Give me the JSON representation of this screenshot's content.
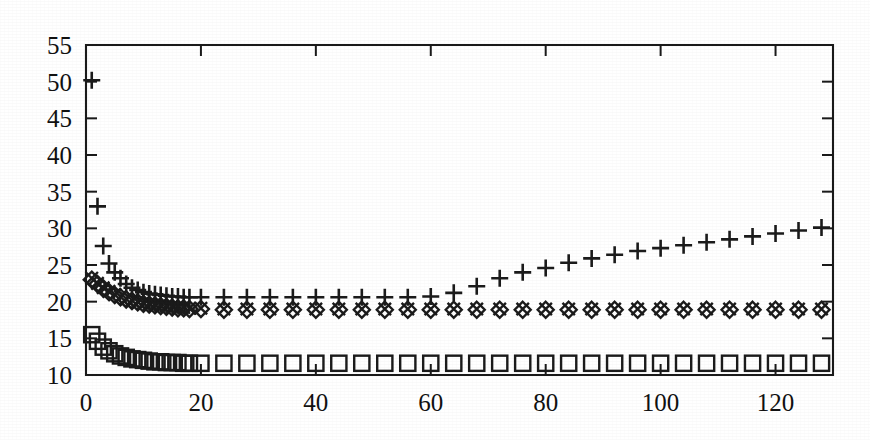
{
  "figure": {
    "title": "",
    "background_color": "#ffffff",
    "ink_color": "#1b1b1b"
  },
  "axes": {
    "y_ticklabels": [
      "10",
      "15",
      "20",
      "25",
      "30",
      "35",
      "40",
      "45",
      "50",
      "55"
    ],
    "x_ticklabels": [
      "0",
      "20",
      "40",
      "60",
      "80",
      "100",
      "120"
    ],
    "xlabel": "",
    "ylabel": ""
  },
  "chart_data": {
    "type": "scatter",
    "title": "",
    "xlabel": "",
    "ylabel": "",
    "xlim": [
      0,
      130
    ],
    "ylim": [
      10,
      55
    ],
    "xticks": [
      0,
      20,
      40,
      60,
      80,
      100,
      120
    ],
    "yticks": [
      10,
      15,
      20,
      25,
      30,
      35,
      40,
      45,
      50,
      55
    ],
    "grid": false,
    "legend": "none",
    "series": [
      {
        "name": "plus-series",
        "marker": "plus",
        "x": [
          1,
          2,
          3,
          4,
          5,
          6,
          7,
          8,
          9,
          10,
          11,
          12,
          13,
          14,
          15,
          16,
          17,
          18,
          20,
          24,
          28,
          32,
          36,
          40,
          44,
          48,
          52,
          56,
          60,
          64,
          68,
          72,
          76,
          80,
          84,
          88,
          92,
          96,
          100,
          104,
          108,
          112,
          116,
          120,
          124,
          128
        ],
        "y": [
          50.2,
          33.0,
          27.6,
          25.2,
          24.0,
          23.2,
          22.4,
          21.9,
          21.6,
          21.3,
          21.1,
          21.0,
          20.9,
          20.8,
          20.7,
          20.7,
          20.6,
          20.6,
          20.6,
          20.6,
          20.6,
          20.6,
          20.6,
          20.6,
          20.6,
          20.6,
          20.6,
          20.6,
          20.7,
          21.2,
          22.1,
          23.2,
          24.0,
          24.6,
          25.3,
          25.9,
          26.4,
          26.9,
          27.3,
          27.7,
          28.1,
          28.5,
          28.9,
          29.3,
          29.7,
          30.1
        ]
      },
      {
        "name": "diamond-series",
        "marker": "diamond",
        "x": [
          1,
          2,
          3,
          4,
          5,
          6,
          7,
          8,
          9,
          10,
          11,
          12,
          13,
          14,
          15,
          16,
          17,
          18,
          20,
          24,
          28,
          32,
          36,
          40,
          44,
          48,
          52,
          56,
          60,
          64,
          68,
          72,
          76,
          80,
          84,
          88,
          92,
          96,
          100,
          104,
          108,
          112,
          116,
          120,
          124,
          128
        ],
        "y": [
          23.0,
          22.4,
          21.8,
          21.3,
          20.9,
          20.6,
          20.3,
          20.1,
          19.9,
          19.7,
          19.6,
          19.5,
          19.4,
          19.3,
          19.2,
          19.1,
          19.1,
          19.0,
          19.0,
          18.9,
          18.9,
          18.9,
          18.9,
          18.9,
          18.9,
          18.9,
          18.9,
          18.9,
          18.9,
          18.9,
          18.9,
          18.9,
          18.9,
          18.9,
          18.9,
          18.9,
          18.9,
          18.9,
          18.9,
          18.9,
          18.9,
          18.9,
          18.9,
          18.9,
          18.9,
          18.9
        ]
      },
      {
        "name": "cross-series",
        "marker": "cross",
        "x": [
          1,
          2,
          3,
          4,
          5,
          6,
          7,
          8,
          9,
          10,
          11,
          12,
          13,
          14,
          15,
          16,
          17,
          18,
          20,
          24,
          28,
          32,
          36,
          40,
          44,
          48,
          52,
          56,
          60,
          64,
          68,
          72,
          76,
          80,
          84,
          88,
          92,
          96,
          100,
          104,
          108,
          112,
          116,
          120,
          124,
          128
        ],
        "y": [
          23.2,
          22.5,
          21.9,
          21.4,
          21.0,
          20.7,
          20.4,
          20.2,
          20.0,
          19.8,
          19.7,
          19.6,
          19.5,
          19.4,
          19.3,
          19.2,
          19.2,
          19.1,
          19.1,
          19.0,
          19.0,
          19.0,
          19.0,
          19.0,
          19.0,
          19.0,
          19.0,
          19.0,
          19.0,
          19.0,
          19.0,
          19.0,
          19.0,
          19.0,
          19.0,
          19.0,
          19.0,
          19.0,
          19.0,
          19.0,
          19.0,
          19.0,
          19.0,
          19.0,
          19.0,
          19.0
        ]
      },
      {
        "name": "square-series",
        "marker": "square",
        "x": [
          1,
          2,
          3,
          4,
          5,
          6,
          7,
          8,
          9,
          10,
          11,
          12,
          13,
          14,
          15,
          16,
          17,
          18,
          20,
          24,
          28,
          32,
          36,
          40,
          44,
          48,
          52,
          56,
          60,
          64,
          68,
          72,
          76,
          80,
          84,
          88,
          92,
          96,
          100,
          104,
          108,
          112,
          116,
          120,
          124,
          128
        ],
        "y": [
          15.5,
          14.6,
          13.8,
          13.3,
          12.9,
          12.6,
          12.4,
          12.2,
          12.1,
          12.0,
          11.9,
          11.8,
          11.8,
          11.7,
          11.7,
          11.7,
          11.6,
          11.6,
          11.6,
          11.6,
          11.6,
          11.6,
          11.6,
          11.6,
          11.6,
          11.6,
          11.6,
          11.6,
          11.6,
          11.6,
          11.6,
          11.6,
          11.6,
          11.6,
          11.6,
          11.6,
          11.6,
          11.6,
          11.6,
          11.6,
          11.6,
          11.6,
          11.6,
          11.6,
          11.6,
          11.6
        ]
      }
    ]
  }
}
